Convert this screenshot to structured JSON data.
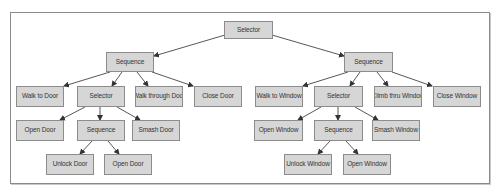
{
  "colors": {
    "node_fill": "#d6d6d6",
    "node_border": "#8c8c8c",
    "edge": "#444444",
    "frame": "#8a8a8a"
  },
  "nodes": [
    {
      "id": "root",
      "label": "Selector",
      "x": 224,
      "y": 21,
      "w": 49,
      "h": 18
    },
    {
      "id": "seq_door",
      "label": "Sequence",
      "x": 106,
      "y": 52,
      "w": 48,
      "h": 20
    },
    {
      "id": "walk_door",
      "label": "Walk to Door",
      "x": 16,
      "y": 86,
      "w": 48,
      "h": 21
    },
    {
      "id": "sel_door",
      "label": "Selector",
      "x": 77,
      "y": 86,
      "w": 48,
      "h": 21
    },
    {
      "id": "walk_through_door",
      "label": "Walk through Door",
      "x": 135,
      "y": 86,
      "w": 48,
      "h": 21
    },
    {
      "id": "close_door",
      "label": "Close Door",
      "x": 194,
      "y": 86,
      "w": 48,
      "h": 21
    },
    {
      "id": "open_door_1",
      "label": "Open Door",
      "x": 16,
      "y": 120,
      "w": 48,
      "h": 21
    },
    {
      "id": "seq_door_2",
      "label": "Sequence",
      "x": 77,
      "y": 120,
      "w": 48,
      "h": 21
    },
    {
      "id": "smash_door",
      "label": "Smash Door",
      "x": 132,
      "y": 120,
      "w": 48,
      "h": 21
    },
    {
      "id": "unlock_door",
      "label": "Unlock Door",
      "x": 46,
      "y": 154,
      "w": 48,
      "h": 21
    },
    {
      "id": "open_door_2",
      "label": "Open Door",
      "x": 104,
      "y": 154,
      "w": 48,
      "h": 21
    },
    {
      "id": "seq_window",
      "label": "Sequence",
      "x": 344,
      "y": 52,
      "w": 49,
      "h": 20
    },
    {
      "id": "walk_window",
      "label": "Walk to Window",
      "x": 255,
      "y": 86,
      "w": 48,
      "h": 21
    },
    {
      "id": "sel_window",
      "label": "Selector",
      "x": 314,
      "y": 86,
      "w": 49,
      "h": 21
    },
    {
      "id": "climb_window",
      "label": "Climb thru Window",
      "x": 374,
      "y": 86,
      "w": 48,
      "h": 21
    },
    {
      "id": "close_window",
      "label": "Close Window",
      "x": 433,
      "y": 86,
      "w": 48,
      "h": 21
    },
    {
      "id": "open_window_1",
      "label": "Open Window",
      "x": 254,
      "y": 120,
      "w": 49,
      "h": 21
    },
    {
      "id": "seq_window_2",
      "label": "Sequence",
      "x": 314,
      "y": 120,
      "w": 49,
      "h": 21
    },
    {
      "id": "smash_window",
      "label": "Smash Window",
      "x": 372,
      "y": 120,
      "w": 48,
      "h": 21
    },
    {
      "id": "unlock_window",
      "label": "Unlock Window",
      "x": 284,
      "y": 154,
      "w": 48,
      "h": 21
    },
    {
      "id": "open_window_2",
      "label": "Open Window",
      "x": 343,
      "y": 154,
      "w": 48,
      "h": 21
    }
  ],
  "edges": [
    {
      "from": "root",
      "to": "seq_door",
      "x1": 225,
      "y1": 35,
      "x2": 154,
      "y2": 56
    },
    {
      "from": "root",
      "to": "seq_window",
      "x1": 272,
      "y1": 35,
      "x2": 344,
      "y2": 56
    },
    {
      "from": "seq_door",
      "to": "walk_door",
      "x1": 110,
      "y1": 72,
      "x2": 64,
      "y2": 86
    },
    {
      "from": "seq_door",
      "to": "sel_door",
      "x1": 122,
      "y1": 72,
      "x2": 112,
      "y2": 86
    },
    {
      "from": "seq_door",
      "to": "walk_through_door",
      "x1": 137,
      "y1": 72,
      "x2": 148,
      "y2": 86
    },
    {
      "from": "seq_door",
      "to": "close_door",
      "x1": 152,
      "y1": 72,
      "x2": 193,
      "y2": 86
    },
    {
      "from": "sel_door",
      "to": "open_door_1",
      "x1": 85,
      "y1": 107,
      "x2": 60,
      "y2": 120
    },
    {
      "from": "sel_door",
      "to": "seq_door_2",
      "x1": 100,
      "y1": 107,
      "x2": 100,
      "y2": 120
    },
    {
      "from": "sel_door",
      "to": "smash_door",
      "x1": 117,
      "y1": 107,
      "x2": 140,
      "y2": 120
    },
    {
      "from": "seq_door_2",
      "to": "unlock_door",
      "x1": 92,
      "y1": 141,
      "x2": 80,
      "y2": 154
    },
    {
      "from": "seq_door_2",
      "to": "open_door_2",
      "x1": 108,
      "y1": 141,
      "x2": 119,
      "y2": 154
    },
    {
      "from": "seq_window",
      "to": "walk_window",
      "x1": 348,
      "y1": 72,
      "x2": 303,
      "y2": 86
    },
    {
      "from": "seq_window",
      "to": "sel_window",
      "x1": 360,
      "y1": 72,
      "x2": 350,
      "y2": 86
    },
    {
      "from": "seq_window",
      "to": "climb_window",
      "x1": 377,
      "y1": 72,
      "x2": 388,
      "y2": 86
    },
    {
      "from": "seq_window",
      "to": "close_window",
      "x1": 392,
      "y1": 72,
      "x2": 432,
      "y2": 86
    },
    {
      "from": "sel_window",
      "to": "open_window_1",
      "x1": 321,
      "y1": 107,
      "x2": 298,
      "y2": 120
    },
    {
      "from": "sel_window",
      "to": "seq_window_2",
      "x1": 338,
      "y1": 107,
      "x2": 338,
      "y2": 120
    },
    {
      "from": "sel_window",
      "to": "smash_window",
      "x1": 355,
      "y1": 107,
      "x2": 378,
      "y2": 120
    },
    {
      "from": "seq_window_2",
      "to": "unlock_window",
      "x1": 330,
      "y1": 141,
      "x2": 318,
      "y2": 154
    },
    {
      "from": "seq_window_2",
      "to": "open_window_2",
      "x1": 346,
      "y1": 141,
      "x2": 358,
      "y2": 154
    }
  ]
}
